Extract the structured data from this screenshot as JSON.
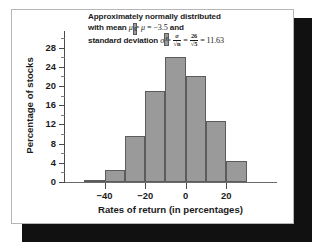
{
  "figure": {
    "name": "sampling-distribution-histogram"
  },
  "annotation": {
    "line1": "Approximately normally distributed",
    "line2_pre": "with mean ",
    "line2_mu_xbar": "μ",
    "line2_sub": "x̄",
    "line2_eq1": " = ",
    "line2_mu": "μ",
    "line2_eq2": " = ",
    "line2_value": "−3.5",
    "line2_post": " and",
    "line3_pre": "standard deviation ",
    "line3_sigma_xbar": "σ",
    "line3_sub": "x̄",
    "line3_eq1": " = ",
    "frac1_num": "σ",
    "frac1_den": "√n",
    "line3_eq2": " = ",
    "frac2_num": "26",
    "frac2_den": "√5",
    "line3_eq3": " = ",
    "line3_value": "11.63"
  },
  "chart_data": {
    "type": "bar",
    "title": "",
    "xlabel": "Rates of return (in percentages)",
    "ylabel": "Percentage of stocks",
    "categories": [
      "-45",
      "-35",
      "-25",
      "-15",
      "-5",
      "5",
      "15",
      "25"
    ],
    "bin_edges": [
      -50,
      -40,
      -30,
      -20,
      -10,
      0,
      10,
      20,
      30
    ],
    "values": [
      0.5,
      2.4,
      9.5,
      19.0,
      26.0,
      22.0,
      12.7,
      4.4
    ],
    "x": [
      -45,
      -35,
      -25,
      -15,
      -5,
      5,
      15,
      25
    ],
    "xlim": [
      -60,
      45
    ],
    "ylim": [
      0,
      30
    ],
    "xticks": [
      -40,
      -20,
      0,
      20
    ],
    "xtick_labels": [
      "−40",
      "−20",
      "0",
      "20"
    ],
    "yticks": [
      0,
      4,
      8,
      12,
      16,
      20,
      24,
      28
    ],
    "ytick_labels": [
      "0",
      "4",
      "8",
      "12",
      "16",
      "20",
      "24",
      "28"
    ],
    "yticks_minor": [
      2,
      6,
      10,
      14,
      18,
      22,
      26,
      30
    ],
    "grid": false,
    "legend": false,
    "bar_color": "#9a9a9a",
    "bar_edge_color": "#5c5c5c",
    "axis_color": "#4a4a4a"
  }
}
